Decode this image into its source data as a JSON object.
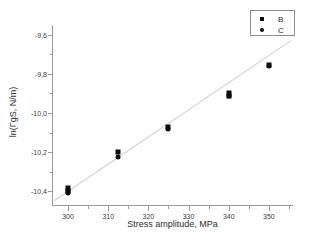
{
  "chart_data": {
    "type": "scatter",
    "title": "",
    "xlabel": "Stress amplitude, MPa",
    "ylabel": "ln(ГgS, N/m)",
    "xlim": [
      296,
      356
    ],
    "ylim": [
      -10.47,
      -9.55
    ],
    "grid": false,
    "legend_position": "top-right",
    "x_ticks": [
      {
        "value": 300,
        "label": "300"
      },
      {
        "value": 310,
        "label": "310"
      },
      {
        "value": 320,
        "label": "320"
      },
      {
        "value": 330,
        "label": "330"
      },
      {
        "value": 340,
        "label": "340"
      },
      {
        "value": 350,
        "label": "350"
      }
    ],
    "x_minor_ticks": [
      305,
      315,
      325,
      335,
      345,
      355
    ],
    "y_ticks": [
      {
        "value": -9.6,
        "label": "-9,6"
      },
      {
        "value": -9.8,
        "label": "-9,8"
      },
      {
        "value": -10.0,
        "label": "-10,0"
      },
      {
        "value": -10.2,
        "label": "-10,2"
      },
      {
        "value": -10.4,
        "label": "-10,4"
      }
    ],
    "y_minor_ticks": [
      -9.7,
      -9.9,
      -10.1,
      -10.3
    ],
    "series": [
      {
        "name": "B",
        "marker": "square",
        "color": "#0d0d0d",
        "points": [
          {
            "x": 300,
            "y": -10.385
          },
          {
            "x": 300,
            "y": -10.4
          },
          {
            "x": 312.5,
            "y": -10.2
          },
          {
            "x": 325,
            "y": -10.07
          },
          {
            "x": 340,
            "y": -9.9
          },
          {
            "x": 340,
            "y": -9.915
          },
          {
            "x": 350,
            "y": -9.755
          }
        ]
      },
      {
        "name": "C",
        "marker": "circle",
        "color": "#0d0d0d",
        "points": [
          {
            "x": 300,
            "y": -10.4
          },
          {
            "x": 300,
            "y": -10.41
          },
          {
            "x": 312.5,
            "y": -10.225
          },
          {
            "x": 325,
            "y": -10.08
          },
          {
            "x": 340,
            "y": -9.915
          },
          {
            "x": 350,
            "y": -9.76
          }
        ]
      }
    ],
    "fit_line": {
      "name": "linear-fit",
      "color": "#d2d2d2",
      "x_start": 296.5,
      "y_start": -10.448,
      "x_end": 355.5,
      "y_end": -9.63
    }
  },
  "legend": {
    "entries": [
      {
        "label": "B",
        "marker": "square"
      },
      {
        "label": "C",
        "marker": "circle"
      }
    ]
  }
}
